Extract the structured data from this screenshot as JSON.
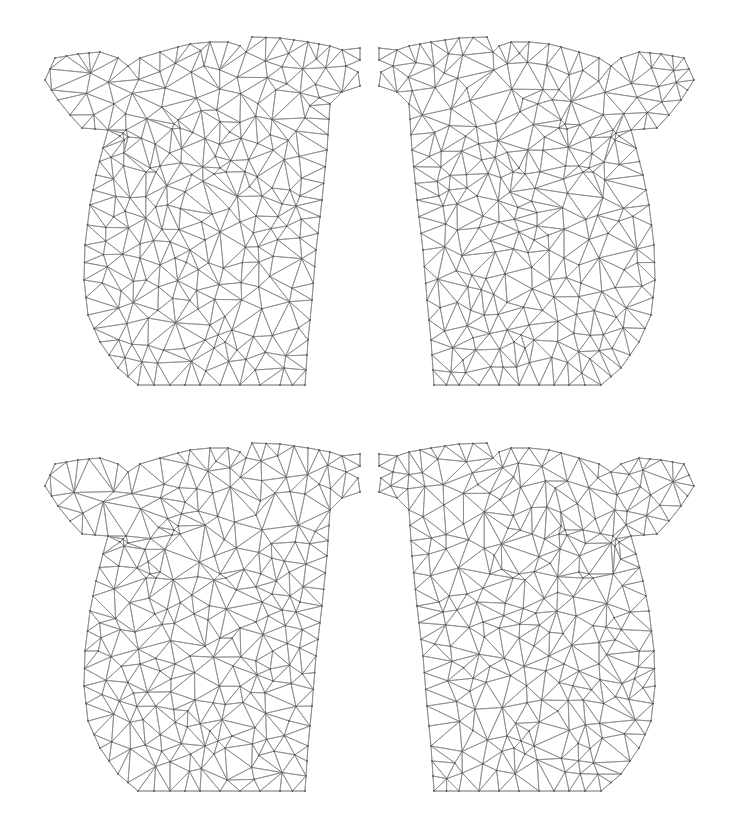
{
  "figure": {
    "line_color": "#8a8a8a",
    "background": "#ffffff"
  },
  "panels": [
    {
      "id": "top-left",
      "x": 0,
      "y": 0,
      "mirror": false,
      "seed": 11
    },
    {
      "id": "top-right",
      "x": 369,
      "y": 0,
      "mirror": true,
      "seed": 23
    },
    {
      "id": "bottom-left",
      "x": 0,
      "y": 406,
      "mirror": false,
      "seed": 37
    },
    {
      "id": "bottom-right",
      "x": 369,
      "y": 406,
      "mirror": true,
      "seed": 41
    }
  ],
  "mesh": {
    "outline": [
      [
        45,
        80
      ],
      [
        55,
        58
      ],
      [
        78,
        54
      ],
      [
        100,
        52
      ],
      [
        118,
        58
      ],
      [
        128,
        66
      ],
      [
        140,
        58
      ],
      [
        160,
        52
      ],
      [
        178,
        47
      ],
      [
        190,
        44
      ],
      [
        210,
        42
      ],
      [
        228,
        42
      ],
      [
        240,
        46
      ],
      [
        246,
        52
      ],
      [
        252,
        37
      ],
      [
        280,
        38
      ],
      [
        308,
        42
      ],
      [
        330,
        46
      ],
      [
        342,
        50
      ],
      [
        360,
        48
      ],
      [
        360,
        60
      ],
      [
        346,
        66
      ],
      [
        358,
        72
      ],
      [
        360,
        86
      ],
      [
        342,
        92
      ],
      [
        330,
        104
      ],
      [
        327,
        150
      ],
      [
        322,
        200
      ],
      [
        316,
        250
      ],
      [
        312,
        300
      ],
      [
        308,
        340
      ],
      [
        305,
        385
      ],
      [
        280,
        385
      ],
      [
        240,
        385
      ],
      [
        200,
        385
      ],
      [
        170,
        385
      ],
      [
        138,
        385
      ],
      [
        118,
        368
      ],
      [
        100,
        342
      ],
      [
        88,
        315
      ],
      [
        84,
        280
      ],
      [
        85,
        245
      ],
      [
        90,
        205
      ],
      [
        96,
        175
      ],
      [
        103,
        148
      ],
      [
        108,
        130
      ],
      [
        82,
        128
      ],
      [
        70,
        115
      ],
      [
        58,
        100
      ]
    ],
    "features": [
      [
        123,
        133
      ],
      [
        126,
        130
      ],
      [
        120,
        136
      ],
      [
        128,
        137
      ],
      [
        124,
        140
      ],
      [
        174,
        124
      ],
      [
        178,
        120
      ],
      [
        172,
        129
      ],
      [
        180,
        128
      ],
      [
        150,
        168
      ],
      [
        156,
        172
      ],
      [
        160,
        166
      ],
      [
        146,
        172
      ],
      [
        220,
        168
      ],
      [
        226,
        172
      ],
      [
        214,
        174
      ],
      [
        272,
        188
      ],
      [
        290,
        190
      ],
      [
        300,
        196
      ],
      [
        282,
        204
      ],
      [
        296,
        206
      ],
      [
        262,
        196
      ],
      [
        220,
        232
      ],
      [
        205,
        240
      ],
      [
        190,
        250
      ],
      [
        175,
        258
      ],
      [
        160,
        265
      ],
      [
        140,
        258
      ],
      [
        240,
        222
      ],
      [
        256,
        216
      ],
      [
        210,
        325
      ],
      [
        218,
        335
      ],
      [
        225,
        342
      ],
      [
        205,
        340
      ],
      [
        232,
        330
      ],
      [
        214,
        348
      ]
    ],
    "interior_point_count": 230
  }
}
